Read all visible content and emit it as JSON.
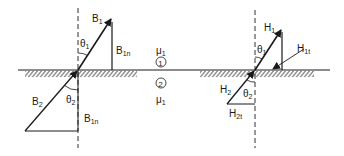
{
  "diagram": {
    "left": {
      "B1": {
        "main": "B",
        "sub": "1"
      },
      "B1n_top": {
        "main": "B",
        "sub": "1n"
      },
      "theta1": {
        "main": "θ",
        "sub": "1"
      },
      "B2": {
        "main": "B",
        "sub": "2"
      },
      "theta2": {
        "main": "θ",
        "sub": "2"
      },
      "B1n_bottom": {
        "main": "B",
        "sub": "1n"
      }
    },
    "center": {
      "mu_top": {
        "main": "μ",
        "sub": "1"
      },
      "region_1": "1",
      "region_2": "2",
      "mu_bottom": {
        "main": "μ",
        "sub": "1"
      }
    },
    "right": {
      "H1": {
        "main": "H",
        "sub": "1"
      },
      "H1t": {
        "main": "H",
        "sub": "1t"
      },
      "theta1": {
        "main": "θ",
        "sub": "1"
      },
      "H2": {
        "main": "H",
        "sub": "2"
      },
      "theta2": {
        "main": "θ",
        "sub": "2"
      },
      "H2t": {
        "main": "H",
        "sub": "2t"
      }
    },
    "colors": {
      "ink": "#1a1a1a",
      "background": "#ffffff"
    }
  }
}
